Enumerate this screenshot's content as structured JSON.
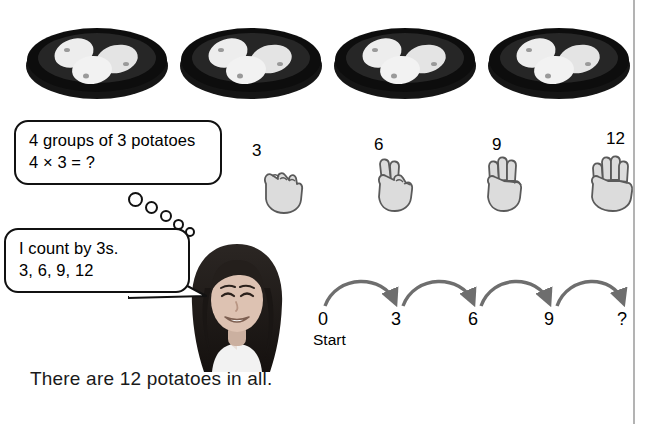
{
  "page": {
    "background_color": "#ffffff",
    "rule_color": "#b3b3b3",
    "rule_x": 633
  },
  "bowls": {
    "count": 4,
    "potatoes_per_bowl": 3,
    "bowl_color": "#111111",
    "potato_color": "#e8e8e8",
    "items": [
      {
        "name": "bowl-1",
        "left": 22
      },
      {
        "name": "bowl-2",
        "left": 176
      },
      {
        "name": "bowl-3",
        "left": 330
      },
      {
        "name": "bowl-4",
        "left": 484
      }
    ]
  },
  "bubbles": {
    "groups": {
      "line1": "4 groups of 3 potatoes",
      "line2": "4 × 3 = ?"
    },
    "count_by": {
      "line1": "I count by 3s.",
      "line2": "3, 6, 9, 12"
    }
  },
  "hands": {
    "hand_color": "#d9d9d9",
    "outline_color": "#555555",
    "items": [
      {
        "label": "3",
        "fingers": 0,
        "left": 250,
        "top": 160,
        "label_left": 252,
        "label_top": 150
      },
      {
        "label": "6",
        "fingers": 2,
        "left": 368,
        "top": 158,
        "label_left": 374,
        "label_top": 146
      },
      {
        "label": "9",
        "fingers": 3,
        "left": 478,
        "top": 158,
        "label_left": 488,
        "label_top": 146
      },
      {
        "label": "12",
        "fingers": 4,
        "left": 586,
        "top": 158,
        "label_left": 606,
        "label_top": 140
      }
    ]
  },
  "number_line": {
    "arrow_color": "#6e6e6e",
    "start_sublabel": "Start",
    "ticks": [
      {
        "label": "0",
        "x": 18
      },
      {
        "label": "3",
        "x": 94
      },
      {
        "label": "6",
        "x": 170
      },
      {
        "label": "9",
        "x": 246
      },
      {
        "label": "?",
        "x": 318
      }
    ],
    "hops": 4
  },
  "caption": {
    "text": "There are 12 potatoes in all."
  }
}
